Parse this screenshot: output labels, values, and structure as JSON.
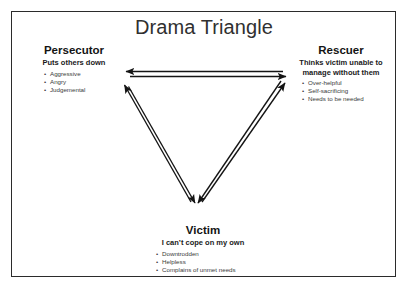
{
  "slide": {
    "title": "Drama Triangle",
    "frame_color": "#2b2b2b",
    "background_color": "#ffffff",
    "arrow_color": "#141414"
  },
  "roles": {
    "persecutor": {
      "name": "Persecutor",
      "tagline": "Puts others down",
      "traits": [
        "Aggressive",
        "Angry",
        "Judgemental"
      ],
      "bullet": "•"
    },
    "rescuer": {
      "name": "Rescuer",
      "tagline": "Thinks victim unable to manage without them",
      "traits": [
        "Over-helpful",
        "Self-sacrificing",
        "Needs to be needed"
      ],
      "bullet": "•"
    },
    "victim": {
      "name": "Victim",
      "tagline": "I can’t cope on my own",
      "traits": [
        "Downtrodden",
        "Helpless",
        "Complains of unmet needs"
      ],
      "bullet": "•"
    }
  },
  "diagram": {
    "type": "triangle-relationship",
    "vertices": [
      {
        "id": "persecutor",
        "label": "Persecutor",
        "x": 125,
        "y": 87
      },
      {
        "id": "rescuer",
        "label": "Rescuer",
        "x": 285,
        "y": 80
      },
      {
        "id": "victim",
        "label": "Victim",
        "x": 196,
        "y": 210
      }
    ],
    "edges": [
      {
        "from": "persecutor",
        "to": "rescuer",
        "bidirectional": true
      },
      {
        "from": "persecutor",
        "to": "victim",
        "bidirectional": true
      },
      {
        "from": "rescuer",
        "to": "victim",
        "bidirectional": true
      }
    ]
  }
}
